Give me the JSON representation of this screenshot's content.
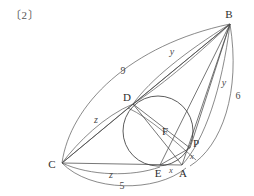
{
  "figure": {
    "problem_tag": "〔2〕",
    "background_color": "#ffffff",
    "stroke_color": "#4a4a4a",
    "label_color": "#3a3a3a"
  },
  "points": [
    {
      "name": "B",
      "label": "B",
      "x": 230,
      "y": 24,
      "label_x": 229,
      "label_y": 14
    },
    {
      "name": "C",
      "label": "C",
      "x": 62,
      "y": 163,
      "label_x": 52,
      "label_y": 164
    },
    {
      "name": "A",
      "label": "A",
      "x": 182,
      "y": 165,
      "label_x": 183,
      "label_y": 173
    },
    {
      "name": "D",
      "label": "D",
      "x": 133,
      "y": 104,
      "label_x": 127,
      "label_y": 97
    },
    {
      "name": "E",
      "label": "E",
      "x": 160,
      "y": 165,
      "label_x": 158,
      "label_y": 173
    },
    {
      "name": "F",
      "label": "F",
      "x": 163,
      "y": 133,
      "label_x": 165,
      "label_y": 131
    },
    {
      "name": "P",
      "label": "P",
      "x": 190,
      "y": 148,
      "label_x": 196,
      "label_y": 143
    }
  ],
  "incircle": {
    "center_x": 158,
    "center_y": 131,
    "radius": 35
  },
  "measure_labels": [
    {
      "name": "arc-label-9",
      "text": "9",
      "kind": "num",
      "x": 123,
      "y": 71
    },
    {
      "name": "arc-label-5",
      "text": "5",
      "kind": "num",
      "x": 122,
      "y": 186
    },
    {
      "name": "arc-label-6",
      "text": "6",
      "kind": "num",
      "x": 238,
      "y": 96
    },
    {
      "name": "arc-label-y-top",
      "text": "y",
      "kind": "var",
      "x": 172,
      "y": 52
    },
    {
      "name": "arc-label-y-right",
      "text": "y",
      "kind": "var",
      "x": 224,
      "y": 83
    },
    {
      "name": "arc-label-z-left",
      "text": "z",
      "kind": "var",
      "x": 96,
      "y": 120
    },
    {
      "name": "arc-label-z-bottom",
      "text": "z",
      "kind": "var",
      "x": 111,
      "y": 175
    },
    {
      "name": "arc-label-x-bottom",
      "text": "x",
      "kind": "var-sm",
      "x": 171,
      "y": 170
    },
    {
      "name": "arc-label-x-right",
      "text": "x",
      "kind": "var-sm",
      "x": 192,
      "y": 156
    }
  ],
  "segments": [
    {
      "name": "segment-B-C",
      "from": "B",
      "to": "C"
    },
    {
      "name": "segment-B-D",
      "from": "B",
      "to": "D"
    },
    {
      "name": "segment-B-E",
      "from": "B",
      "to": "E"
    },
    {
      "name": "segment-B-A",
      "from": "B",
      "to": "A"
    },
    {
      "name": "segment-B-P",
      "from": "B",
      "to": "P"
    },
    {
      "name": "segment-C-A",
      "from": "C",
      "to": "A"
    },
    {
      "name": "segment-C-D",
      "from": "C",
      "to": "D"
    },
    {
      "name": "segment-D-A",
      "from": "D",
      "to": "A"
    },
    {
      "name": "segment-D-P",
      "from": "D",
      "to": "P"
    },
    {
      "name": "segment-E-P",
      "from": "E",
      "to": "P"
    }
  ],
  "arcs": [
    {
      "name": "arc-C-B-outer-9",
      "d": "M 62 163 C 70 105, 130 45, 230 24"
    },
    {
      "name": "arc-D-B-y",
      "d": "M 133 104 C 150 80, 185 52, 230 24"
    },
    {
      "name": "arc-D-B-y-inner",
      "d": "M 133 104 C 158 88, 192 60, 230 24"
    },
    {
      "name": "arc-A-B-y-right",
      "d": "M 182 165 C 205 140, 222 88, 230 24"
    },
    {
      "name": "arc-P-B-6",
      "d": "M 190 166 C 222 146, 241 92, 230 24"
    },
    {
      "name": "arc-C-D-z",
      "d": "M 62 163 C 78 142, 104 116, 133 104"
    },
    {
      "name": "arc-C-E-z",
      "d": "M 62 163 C 90 176, 132 177, 160 167"
    },
    {
      "name": "arc-C-A-5",
      "d": "M 62 163 C 90 192, 156 193, 186 168"
    },
    {
      "name": "arc-D-A-sweep",
      "d": "M 128 108 C 150 118, 176 142, 196 160"
    }
  ]
}
